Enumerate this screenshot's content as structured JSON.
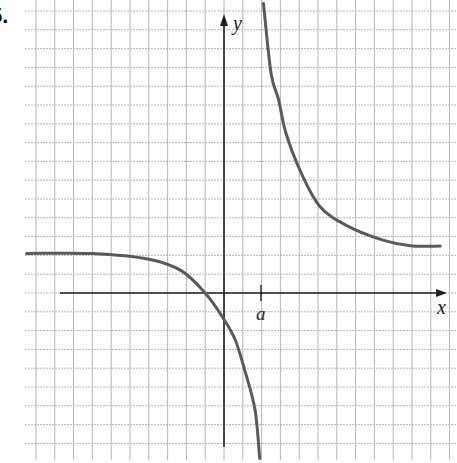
{
  "problem": {
    "number_label": "5."
  },
  "colors": {
    "grid": "#b4b4b4",
    "axis": "#1e1e1e",
    "curve": "#5a5a5a",
    "background": "#ffffff"
  },
  "chart_data": {
    "type": "line",
    "title": "",
    "xlabel": "x",
    "ylabel": "y",
    "grid": true,
    "grid_spacing_px": 18.8,
    "annotations": [
      {
        "text": "a",
        "position": "x-axis tick, vertical asymptote location",
        "x_units": 2
      }
    ],
    "axis_labels": {
      "x": "x",
      "y": "y",
      "a": "a"
    },
    "xlim": [
      -10.5,
      11.5
    ],
    "ylim": [
      -8.5,
      15.5
    ],
    "asymptotes": {
      "vertical_x_units": 2,
      "horizontal_y_units": 2.1
    },
    "series": [
      {
        "name": "left-branch",
        "points_units": [
          [
            -10.5,
            2.1
          ],
          [
            -7,
            2.1
          ],
          [
            -4,
            1.8
          ],
          [
            -2.3,
            1.2
          ],
          [
            -1,
            0
          ],
          [
            0,
            -1.4
          ],
          [
            0.6,
            -2.5
          ],
          [
            1.1,
            -4.1
          ],
          [
            1.65,
            -6.2
          ],
          [
            1.9,
            -8.8
          ]
        ]
      },
      {
        "name": "right-branch",
        "points_units": [
          [
            2.1,
            15.4
          ],
          [
            2.5,
            11.7
          ],
          [
            2.9,
            10.3
          ],
          [
            3.3,
            8.5
          ],
          [
            4.1,
            6.4
          ],
          [
            5.1,
            4.6
          ],
          [
            6.5,
            3.6
          ],
          [
            8.5,
            2.8
          ],
          [
            10,
            2.5
          ],
          [
            11.5,
            2.5
          ]
        ]
      }
    ]
  }
}
